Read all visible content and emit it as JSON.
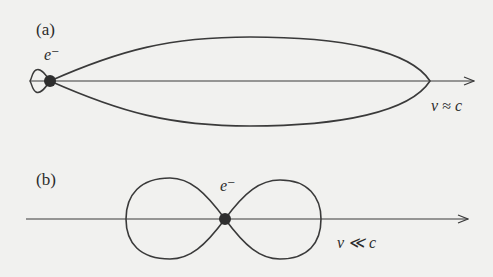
{
  "figure": {
    "panel_a": {
      "label": "(a)",
      "particle": "e⁻",
      "velocity_label": "v ≈ c",
      "description": "forward-beamed radiation lobe"
    },
    "panel_b": {
      "label": "(b)",
      "particle": "e⁻",
      "velocity_label": "v ≪ c",
      "description": "dipole radiation pattern"
    }
  },
  "colors": {
    "background": "#f1f1ef",
    "ink": "#3a3a3a"
  }
}
